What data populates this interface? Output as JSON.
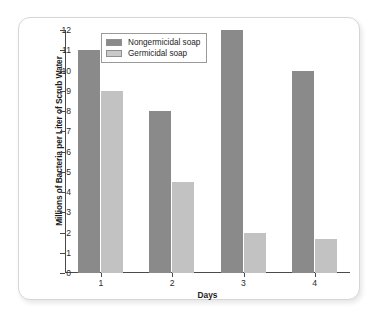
{
  "chart_data": {
    "type": "bar",
    "title": "",
    "xlabel": "Days",
    "ylabel": "Millions of Bacteria per Liter of Scrub Water",
    "categories": [
      "1",
      "2",
      "3",
      "4"
    ],
    "ylim": [
      0,
      12
    ],
    "yticks": [
      "0",
      "1",
      "2",
      "3",
      "4",
      "5",
      "6",
      "7",
      "8",
      "9",
      "10",
      "11",
      "12"
    ],
    "grid": false,
    "legend_position": "top-center",
    "series": [
      {
        "name": "Nongermicidal soap",
        "color": "#8a8a8a",
        "values": [
          11,
          8,
          12,
          10
        ]
      },
      {
        "name": "Germicidal soap",
        "color": "#c2c2c2",
        "values": [
          9,
          4.5,
          2,
          1.7
        ]
      }
    ]
  }
}
